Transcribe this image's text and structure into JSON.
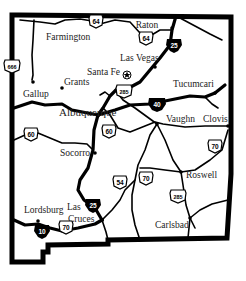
{
  "map": {
    "title": "New Mexico",
    "colors": {
      "border": "#000000",
      "road": "#000000",
      "label": "#222222",
      "background": "#ffffff"
    },
    "cities": [
      {
        "name": "Farmington",
        "x": 46,
        "y": 40
      },
      {
        "name": "Raton",
        "x": 147,
        "y": 28
      },
      {
        "name": "Las Vegas",
        "x": 120,
        "y": 61
      },
      {
        "name": "Santa Fe",
        "x": 88,
        "y": 73
      },
      {
        "name": "Grants",
        "x": 65,
        "y": 86
      },
      {
        "name": "Gallup",
        "x": 24,
        "y": 96
      },
      {
        "name": "Tucumcari",
        "x": 173,
        "y": 87
      },
      {
        "name": "Albuquerque",
        "x": 59,
        "y": 115
      },
      {
        "name": "Vaughn",
        "x": 166,
        "y": 122
      },
      {
        "name": "Clovis",
        "x": 203,
        "y": 122
      },
      {
        "name": "Socorro",
        "x": 59,
        "y": 157
      },
      {
        "name": "Roswell",
        "x": 186,
        "y": 178
      },
      {
        "name": "Lordsburg",
        "x": 24,
        "y": 213
      },
      {
        "name": "Las",
        "x": 67,
        "y": 210
      },
      {
        "name": "Cruces",
        "x": 68,
        "y": 222
      },
      {
        "name": "Carlsbad",
        "x": 155,
        "y": 228
      }
    ],
    "shields": [
      {
        "type": "us",
        "number": "64",
        "x": 96,
        "y": 21
      },
      {
        "type": "us",
        "number": "64",
        "x": 146,
        "y": 38
      },
      {
        "type": "interstate",
        "number": "25",
        "x": 174,
        "y": 45
      },
      {
        "type": "us",
        "number": "666",
        "x": 12,
        "y": 66
      },
      {
        "type": "us",
        "number": "285",
        "x": 124,
        "y": 91
      },
      {
        "type": "interstate",
        "number": "40",
        "x": 157,
        "y": 104
      },
      {
        "type": "us",
        "number": "60",
        "x": 31,
        "y": 134
      },
      {
        "type": "us",
        "number": "60",
        "x": 109,
        "y": 131
      },
      {
        "type": "us",
        "number": "70",
        "x": 215,
        "y": 146
      },
      {
        "type": "us",
        "number": "54",
        "x": 120,
        "y": 182
      },
      {
        "type": "us",
        "number": "70",
        "x": 146,
        "y": 178
      },
      {
        "type": "us",
        "number": "285",
        "x": 178,
        "y": 196
      },
      {
        "type": "interstate",
        "number": "25",
        "x": 93,
        "y": 205
      },
      {
        "type": "us",
        "number": "70",
        "x": 66,
        "y": 227
      },
      {
        "type": "interstate",
        "number": "10",
        "x": 42,
        "y": 231
      }
    ]
  }
}
